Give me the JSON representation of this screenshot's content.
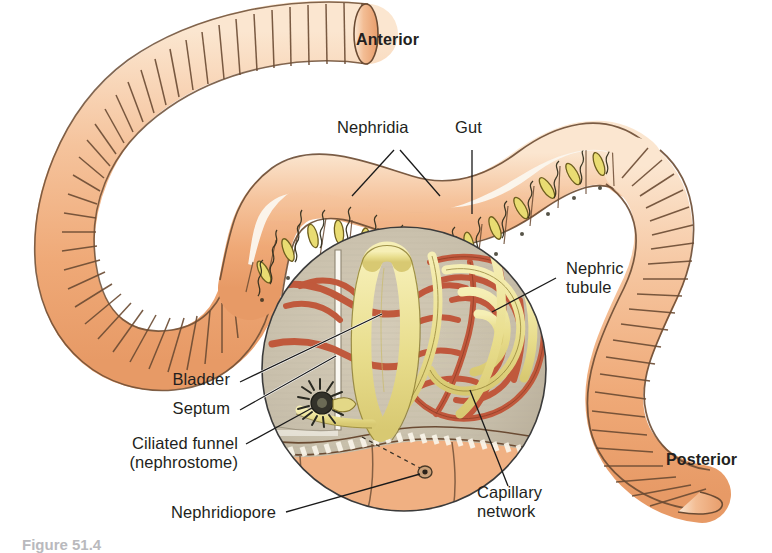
{
  "figure": {
    "orientation_labels": {
      "anterior": "Anterior",
      "posterior": "Posterior"
    },
    "labels": {
      "nephridia": "Nephridia",
      "gut": "Gut",
      "nephric_tubule_line1": "Nephric",
      "nephric_tubule_line2": "tubule",
      "bladder": "Bladder",
      "septum": "Septum",
      "ciliated_funnel_line1": "Ciliated funnel",
      "ciliated_funnel_line2": "(nephrostome)",
      "nephridiopore": "Nephridiopore",
      "capillary_line1": "Capillary",
      "capillary_line2": "network"
    },
    "caption": "Figure 51.4",
    "colors": {
      "worm_body": "#f2b183",
      "worm_highlight": "#fbe6cf",
      "worm_outline": "#5b4330",
      "inset_background": "#c9c0ab",
      "tubule_yellow": "#ece496",
      "tubule_outline": "#7a6a2a",
      "capillary_red": "#c0593c",
      "septum_white": "#f7f5ef",
      "leader_line": "#1a1a1a",
      "text": "#231f20"
    },
    "structures": [
      "nephridia pairs in segments",
      "gut",
      "nephric tubule",
      "bladder",
      "septum",
      "ciliated funnel (nephrostome)",
      "nephridiopore",
      "capillary network"
    ]
  }
}
